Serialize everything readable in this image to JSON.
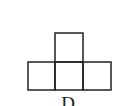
{
  "figure": {
    "label": "D",
    "shape": "T-tetromino net of four squares",
    "stroke_color": "#222222",
    "squares": [
      {
        "x": 55,
        "y": 33,
        "w": 28,
        "h": 29
      },
      {
        "x": 28,
        "y": 62,
        "w": 27,
        "h": 28
      },
      {
        "x": 55,
        "y": 62,
        "w": 28,
        "h": 28
      },
      {
        "x": 83,
        "y": 62,
        "w": 28,
        "h": 28
      }
    ]
  }
}
